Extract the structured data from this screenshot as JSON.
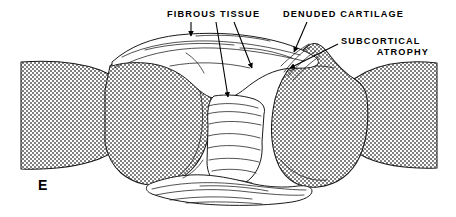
{
  "figure": {
    "panel_letter": "E",
    "background_color": "#ffffff",
    "ink_color": "#000000",
    "bone_fill_color": "#9a9a9a",
    "width": 456,
    "height": 217
  },
  "annotations": [
    {
      "id": "fibrous-tissue",
      "label": "FIBROUS TISSUE",
      "label_lines": [
        "FIBROUS TISSUE"
      ],
      "text_x": 167,
      "text_y": 17,
      "text_anchor": "start"
    },
    {
      "id": "denuded-cartilage",
      "label": "DENUDED CARTILAGE",
      "label_lines": [
        "DENUDED CARTILAGE"
      ],
      "text_x": 283,
      "text_y": 17,
      "text_anchor": "start"
    },
    {
      "id": "subcortical-atrophy",
      "label": "SUBCORTICAL ATROPHY",
      "label_lines": [
        "SUBCORTICAL",
        "ATROPHY"
      ],
      "text_x": 341,
      "text_y": 44,
      "text_anchor": "start"
    }
  ],
  "leaders": {
    "fibrous_tissue_short": "vertical arrow into upper fibrous band",
    "fibrous_tissue_long": "long line down to mid joint space",
    "fibrous_tissue_diagonal": "diagonal line down-right to joint margin",
    "denuded_cartilage_arrow": "arrow down-left to right condyle surface",
    "subcortical_atrophy_arrow": "arrow down-left into right condyle cortex"
  }
}
